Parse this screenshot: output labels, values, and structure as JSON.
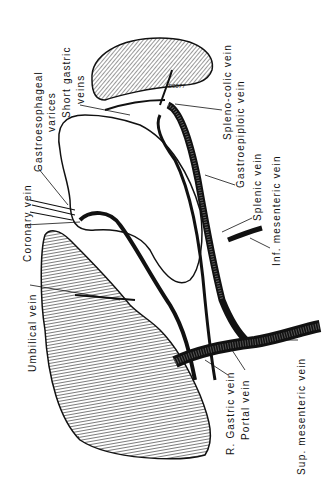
{
  "diagram": {
    "type": "anatomical-illustration",
    "signature": "S0077",
    "labels": [
      {
        "id": "coronary-vein",
        "text": "Coronary vein"
      },
      {
        "id": "gastroesophageal-varices-1",
        "text": "Gastroesophageal"
      },
      {
        "id": "gastroesophageal-varices-2",
        "text": "varices"
      },
      {
        "id": "short-gastric-1",
        "text": "Short gastric"
      },
      {
        "id": "short-gastric-2",
        "text": "veins"
      },
      {
        "id": "umbilical-vein",
        "text": "Umbilical vein"
      },
      {
        "id": "spleno-colic-vein",
        "text": "Spleno-colic vein"
      },
      {
        "id": "gastroepiploic-vein",
        "text": "Gastroepiploic vein"
      },
      {
        "id": "splenic-vein",
        "text": "Splenic vein"
      },
      {
        "id": "inf-mesenteric-vein",
        "text": "Inf. mesenteric vein"
      },
      {
        "id": "r-gastric-vein",
        "text": "R. Gastric vein"
      },
      {
        "id": "portal-vein",
        "text": "Portal vein"
      },
      {
        "id": "sup-mesenteric-vein",
        "text": "Sup. mesenteric vein"
      }
    ]
  }
}
